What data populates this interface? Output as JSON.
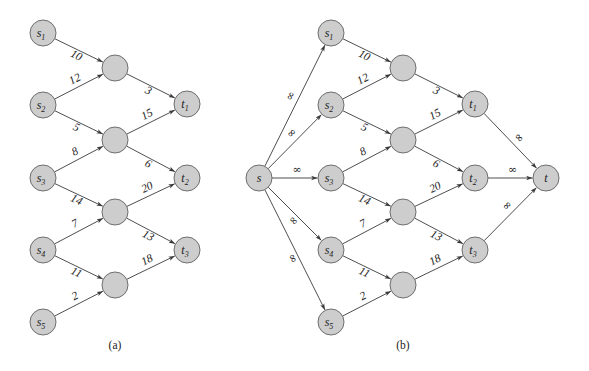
{
  "figure": {
    "node_style": {
      "fill": "#cdcdcd",
      "stroke": "#6e6e6e",
      "radius": 13
    },
    "edge_color": "#3a3a3a"
  },
  "panels": [
    {
      "id": "a",
      "caption": "(a)",
      "caption_pos": [
        115,
        349
      ],
      "nodes": [
        {
          "id": "s1",
          "base": "s",
          "sub": "1",
          "x": 43,
          "y": 33
        },
        {
          "id": "s2",
          "base": "s",
          "sub": "2",
          "x": 43,
          "y": 105
        },
        {
          "id": "s3",
          "base": "s",
          "sub": "3",
          "x": 43,
          "y": 178
        },
        {
          "id": "s4",
          "base": "s",
          "sub": "4",
          "x": 43,
          "y": 250
        },
        {
          "id": "s5",
          "base": "s",
          "sub": "5",
          "x": 43,
          "y": 322
        },
        {
          "id": "m1",
          "base": "",
          "sub": "",
          "x": 115,
          "y": 68
        },
        {
          "id": "m2",
          "base": "",
          "sub": "",
          "x": 115,
          "y": 140
        },
        {
          "id": "m3",
          "base": "",
          "sub": "",
          "x": 115,
          "y": 212
        },
        {
          "id": "m4",
          "base": "",
          "sub": "",
          "x": 115,
          "y": 285
        },
        {
          "id": "t1",
          "base": "t",
          "sub": "1",
          "x": 187,
          "y": 104
        },
        {
          "id": "t2",
          "base": "t",
          "sub": "2",
          "x": 187,
          "y": 178
        },
        {
          "id": "t3",
          "base": "t",
          "sub": "3",
          "x": 187,
          "y": 250
        }
      ],
      "edges": [
        {
          "from": "s1",
          "to": "m1",
          "label": "10",
          "side": "below"
        },
        {
          "from": "s2",
          "to": "m1",
          "label": "12",
          "side": "above"
        },
        {
          "from": "s2",
          "to": "m2",
          "label": "5",
          "side": "below"
        },
        {
          "from": "s3",
          "to": "m2",
          "label": "8",
          "side": "above"
        },
        {
          "from": "s3",
          "to": "m3",
          "label": "14",
          "side": "below"
        },
        {
          "from": "s4",
          "to": "m3",
          "label": "7",
          "side": "above"
        },
        {
          "from": "s4",
          "to": "m4",
          "label": "11",
          "side": "below"
        },
        {
          "from": "s5",
          "to": "m4",
          "label": "2",
          "side": "above"
        },
        {
          "from": "m1",
          "to": "t1",
          "label": "3",
          "side": "below"
        },
        {
          "from": "m2",
          "to": "t1",
          "label": "15",
          "side": "above"
        },
        {
          "from": "m2",
          "to": "t2",
          "label": "6",
          "side": "below"
        },
        {
          "from": "m3",
          "to": "t2",
          "label": "20",
          "side": "above"
        },
        {
          "from": "m3",
          "to": "t3",
          "label": "13",
          "side": "below"
        },
        {
          "from": "m4",
          "to": "t3",
          "label": "18",
          "side": "above"
        }
      ]
    },
    {
      "id": "b",
      "caption": "(b)",
      "caption_pos": [
        403,
        349
      ],
      "nodes": [
        {
          "id": "s",
          "base": "s",
          "sub": "",
          "x": 259,
          "y": 178
        },
        {
          "id": "s1",
          "base": "s",
          "sub": "1",
          "x": 331,
          "y": 33
        },
        {
          "id": "s2",
          "base": "s",
          "sub": "2",
          "x": 331,
          "y": 105
        },
        {
          "id": "s3",
          "base": "s",
          "sub": "3",
          "x": 331,
          "y": 178
        },
        {
          "id": "s4",
          "base": "s",
          "sub": "4",
          "x": 331,
          "y": 250
        },
        {
          "id": "s5",
          "base": "s",
          "sub": "5",
          "x": 331,
          "y": 322
        },
        {
          "id": "m1",
          "base": "",
          "sub": "",
          "x": 403,
          "y": 68
        },
        {
          "id": "m2",
          "base": "",
          "sub": "",
          "x": 403,
          "y": 140
        },
        {
          "id": "m3",
          "base": "",
          "sub": "",
          "x": 403,
          "y": 212
        },
        {
          "id": "m4",
          "base": "",
          "sub": "",
          "x": 403,
          "y": 285
        },
        {
          "id": "t1",
          "base": "t",
          "sub": "1",
          "x": 475,
          "y": 104
        },
        {
          "id": "t2",
          "base": "t",
          "sub": "2",
          "x": 475,
          "y": 178
        },
        {
          "id": "t3",
          "base": "t",
          "sub": "3",
          "x": 475,
          "y": 250
        },
        {
          "id": "t",
          "base": "t",
          "sub": "",
          "x": 546,
          "y": 178
        }
      ],
      "edges": [
        {
          "from": "s",
          "to": "s1",
          "label": "∞",
          "side": "above",
          "inf": true
        },
        {
          "from": "s",
          "to": "s2",
          "label": "∞",
          "side": "above",
          "inf": true
        },
        {
          "from": "s",
          "to": "s3",
          "label": "∞",
          "side": "above",
          "inf": true
        },
        {
          "from": "s",
          "to": "s4",
          "label": "∞",
          "side": "below",
          "inf": true
        },
        {
          "from": "s",
          "to": "s5",
          "label": "∞",
          "side": "below",
          "inf": true
        },
        {
          "from": "s1",
          "to": "m1",
          "label": "10",
          "side": "below"
        },
        {
          "from": "s2",
          "to": "m1",
          "label": "12",
          "side": "above"
        },
        {
          "from": "s2",
          "to": "m2",
          "label": "5",
          "side": "below"
        },
        {
          "from": "s3",
          "to": "m2",
          "label": "8",
          "side": "above"
        },
        {
          "from": "s3",
          "to": "m3",
          "label": "14",
          "side": "below"
        },
        {
          "from": "s4",
          "to": "m3",
          "label": "7",
          "side": "above"
        },
        {
          "from": "s4",
          "to": "m4",
          "label": "11",
          "side": "below"
        },
        {
          "from": "s5",
          "to": "m4",
          "label": "2",
          "side": "above"
        },
        {
          "from": "m1",
          "to": "t1",
          "label": "3",
          "side": "below"
        },
        {
          "from": "m2",
          "to": "t1",
          "label": "15",
          "side": "above"
        },
        {
          "from": "m2",
          "to": "t2",
          "label": "6",
          "side": "below"
        },
        {
          "from": "m3",
          "to": "t2",
          "label": "20",
          "side": "above"
        },
        {
          "from": "m3",
          "to": "t3",
          "label": "13",
          "side": "below"
        },
        {
          "from": "m4",
          "to": "t3",
          "label": "18",
          "side": "above"
        },
        {
          "from": "t1",
          "to": "t",
          "label": "∞",
          "side": "above",
          "inf": true
        },
        {
          "from": "t2",
          "to": "t",
          "label": "∞",
          "side": "above",
          "inf": true
        },
        {
          "from": "t3",
          "to": "t",
          "label": "∞",
          "side": "above",
          "inf": true
        }
      ]
    }
  ]
}
